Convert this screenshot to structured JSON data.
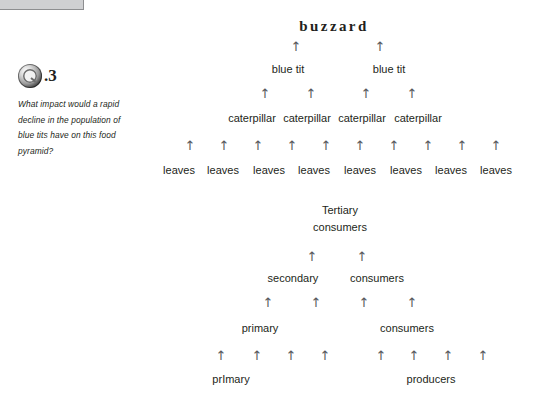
{
  "page": {
    "background": "#ffffff",
    "text_color": "#231f20",
    "arrow_color": "#58595b",
    "top_bar_color": "#cfd0d2"
  },
  "top_bar": {
    "name": "grey-tab-strip"
  },
  "question": {
    "icon": "question-marker-icon",
    "number": ".3",
    "text": "What impact would a rapid decline in the population of blue tits have on this food pyramid?"
  },
  "food_pyramid": {
    "name": "food-pyramid-organisms",
    "arrow_glyph": "↑",
    "levels": [
      {
        "name": "apex-level",
        "y": 20,
        "style": "apex",
        "labels": [
          {
            "text": "buzzard",
            "x": 334
          }
        ]
      },
      {
        "name": "arrows-to-apex",
        "y": 40,
        "arrows": [
          296,
          380
        ]
      },
      {
        "name": "secondary-consumer-level",
        "y": 63,
        "labels": [
          {
            "text": "blue tit",
            "x": 288
          },
          {
            "text": "blue tit",
            "x": 389
          }
        ]
      },
      {
        "name": "arrows-to-secondary",
        "y": 87,
        "arrows": [
          265,
          311,
          366,
          412
        ]
      },
      {
        "name": "primary-consumer-level",
        "y": 112,
        "labels": [
          {
            "text": "caterpillar",
            "x": 252
          },
          {
            "text": "caterpillar",
            "x": 307
          },
          {
            "text": "caterpillar",
            "x": 362
          },
          {
            "text": "caterpillar",
            "x": 418
          }
        ]
      },
      {
        "name": "arrows-to-primary",
        "y": 139,
        "arrows": [
          190,
          224,
          258,
          292,
          326,
          360,
          394,
          428,
          462,
          496
        ]
      },
      {
        "name": "producer-level",
        "y": 164,
        "labels": [
          {
            "text": "leaves",
            "x": 179
          },
          {
            "text": "leaves",
            "x": 223
          },
          {
            "text": "leaves",
            "x": 269
          },
          {
            "text": "leaves",
            "x": 314
          },
          {
            "text": "leaves",
            "x": 360
          },
          {
            "text": "leaves",
            "x": 406
          },
          {
            "text": "leaves",
            "x": 451
          },
          {
            "text": "leaves",
            "x": 496
          }
        ]
      }
    ]
  },
  "trophic_pyramid": {
    "name": "trophic-level-pyramid",
    "arrow_glyph": "↑",
    "levels": [
      {
        "name": "tertiary-consumers-level",
        "y": 204,
        "labels": [
          {
            "text": "Tertiary",
            "x": 340
          },
          {
            "text": "consumers",
            "x": 340,
            "dy": 17
          }
        ]
      },
      {
        "name": "arrows-to-tertiary",
        "y": 250,
        "arrows": [
          312,
          362
        ]
      },
      {
        "name": "secondary-consumers-level",
        "y": 272,
        "labels": [
          {
            "text": "secondary",
            "x": 293
          },
          {
            "text": "consumers",
            "x": 377
          }
        ]
      },
      {
        "name": "arrows-to-secondary-consumers",
        "y": 296,
        "arrows": [
          268,
          316,
          364,
          412
        ]
      },
      {
        "name": "primary-consumers-level",
        "y": 322,
        "labels": [
          {
            "text": "primary",
            "x": 260
          },
          {
            "text": "consumers",
            "x": 407
          }
        ]
      },
      {
        "name": "arrows-to-primary-producers",
        "y": 349,
        "arrows": [
          221,
          257,
          291,
          325,
          381,
          414,
          448,
          483
        ]
      },
      {
        "name": "primary-producers-level",
        "y": 373,
        "labels": [
          {
            "text": "prImary",
            "x": 231
          },
          {
            "text": "producers",
            "x": 431
          }
        ]
      }
    ]
  }
}
